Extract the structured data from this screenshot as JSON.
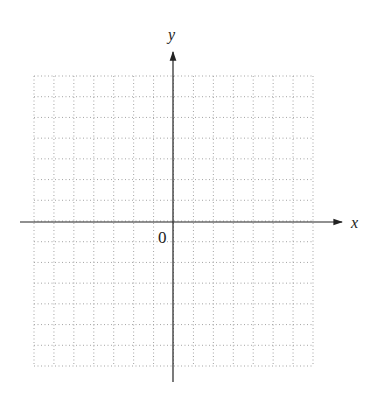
{
  "diagram": {
    "type": "coordinate-plane",
    "labels": {
      "x_axis": "x",
      "y_axis": "y",
      "origin": "0"
    },
    "grid": {
      "columns": 14,
      "rows": 14,
      "columns_left_of_origin": 7,
      "columns_right_of_origin": 7,
      "rows_above_origin": 7,
      "rows_below_origin": 7,
      "line_style": "dotted"
    },
    "colors": {
      "axis": "#222222",
      "grid": "#9a9a9a",
      "background": "#ffffff"
    }
  }
}
